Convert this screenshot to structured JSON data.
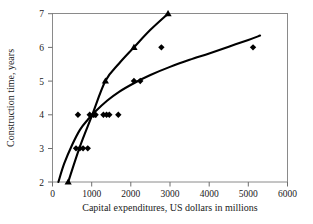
{
  "chart_data": {
    "type": "scatter",
    "title": "",
    "xlabel": "Capital expenditures, US dollars in millions",
    "ylabel": "Construction time, years",
    "xlim": [
      0,
      6000
    ],
    "ylim": [
      2,
      7
    ],
    "xticks": [
      0,
      1000,
      2000,
      3000,
      4000,
      5000,
      6000
    ],
    "yticks": [
      2,
      3,
      4,
      5,
      6,
      7
    ],
    "xtick_labels": [
      "0",
      "1000",
      "2000",
      "3000",
      "4000",
      "5000",
      "6000"
    ],
    "ytick_labels": [
      "2",
      "3",
      "4",
      "5",
      "6",
      "7"
    ],
    "grid": false,
    "legend": "none",
    "series": [
      {
        "name": "diamond-series",
        "marker": "diamond",
        "points": [
          [
            600,
            3.0
          ],
          [
            700,
            3.0
          ],
          [
            780,
            3.0
          ],
          [
            900,
            3.0
          ],
          [
            650,
            4.0
          ],
          [
            950,
            4.0
          ],
          [
            1050,
            4.0
          ],
          [
            1100,
            4.0
          ],
          [
            1300,
            4.0
          ],
          [
            1380,
            4.0
          ],
          [
            1450,
            4.0
          ],
          [
            1680,
            4.0
          ],
          [
            2080,
            5.0
          ],
          [
            2240,
            5.0
          ],
          [
            2780,
            6.0
          ],
          [
            5120,
            6.0
          ]
        ]
      },
      {
        "name": "triangle-series",
        "marker": "triangle",
        "points": [
          [
            400,
            2.0
          ],
          [
            1050,
            4.0
          ],
          [
            1350,
            5.0
          ],
          [
            2080,
            6.0
          ],
          [
            2950,
            7.0
          ]
        ]
      }
    ],
    "fit_curves": [
      {
        "name": "lower-fit-curve",
        "note": "concave logarithmic-type fit through diamond scatter",
        "points": [
          [
            150,
            2.0
          ],
          [
            300,
            2.55
          ],
          [
            500,
            3.1
          ],
          [
            700,
            3.55
          ],
          [
            900,
            3.85
          ],
          [
            1100,
            4.1
          ],
          [
            1400,
            4.42
          ],
          [
            1700,
            4.68
          ],
          [
            2100,
            4.95
          ],
          [
            2500,
            5.18
          ],
          [
            3000,
            5.42
          ],
          [
            3500,
            5.63
          ],
          [
            4000,
            5.82
          ],
          [
            4500,
            6.02
          ],
          [
            5000,
            6.22
          ],
          [
            5300,
            6.35
          ]
        ]
      },
      {
        "name": "upper-fit-curve",
        "note": "steep near-linear fit through triangle series",
        "points": [
          [
            400,
            2.0
          ],
          [
            700,
            3.05
          ],
          [
            1000,
            3.95
          ],
          [
            1350,
            5.0
          ],
          [
            1700,
            5.52
          ],
          [
            2080,
            6.0
          ],
          [
            2500,
            6.52
          ],
          [
            2950,
            7.0
          ]
        ]
      }
    ]
  }
}
